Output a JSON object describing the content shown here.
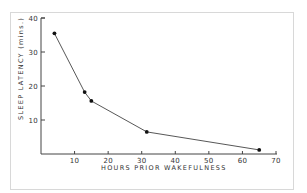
{
  "chart_data": {
    "type": "line",
    "title": "",
    "xlabel": "HOURS PRIOR WAKEFULNESS",
    "ylabel": "SLEEP LATENCY (mins.)",
    "xlim": [
      0,
      70
    ],
    "ylim": [
      0,
      40
    ],
    "x_ticks": [
      10,
      20,
      30,
      40,
      50,
      60,
      70
    ],
    "y_ticks": [
      10,
      20,
      30,
      40
    ],
    "grid": false,
    "legend": null,
    "series": [
      {
        "name": "Sleep latency",
        "x": [
          4,
          13,
          15,
          31.5,
          65
        ],
        "values": [
          35.5,
          18.2,
          15.6,
          6.5,
          1.2
        ]
      }
    ],
    "colors": {
      "line": "#444444",
      "marker": "#111111",
      "axis": "#444444",
      "frame": "#d8d8d8"
    }
  },
  "labels": {
    "x_axis_title": "HOURS   PRIOR   WAKEFULNESS",
    "y_axis_title": "SLEEP   LATENCY   (mins.)",
    "x_tick_labels": [
      "10",
      "20",
      "30",
      "40",
      "50",
      "60",
      "70"
    ],
    "y_tick_labels": [
      "10",
      "20",
      "30",
      "40"
    ]
  }
}
